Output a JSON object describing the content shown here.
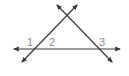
{
  "diagram": {
    "line_color": "#3a3a3a",
    "label_color": "#8a8a8a",
    "labels": {
      "angle1": "1",
      "angle2": "2",
      "angle3": "3"
    },
    "lines": [
      {
        "name": "horizontal-line",
        "from": [
          13,
          49
        ],
        "to": [
          121,
          49
        ],
        "arrows": "both"
      },
      {
        "name": "left-transversal",
        "from": [
          21,
          63
        ],
        "to": [
          78,
          4
        ],
        "arrows": "both"
      },
      {
        "name": "right-transversal",
        "from": [
          56,
          4
        ],
        "to": [
          113,
          63
        ],
        "arrows": "both"
      }
    ],
    "intersections": {
      "left": [
        36,
        49
      ],
      "right": [
        98,
        49
      ],
      "apex": [
        67,
        16
      ]
    }
  }
}
